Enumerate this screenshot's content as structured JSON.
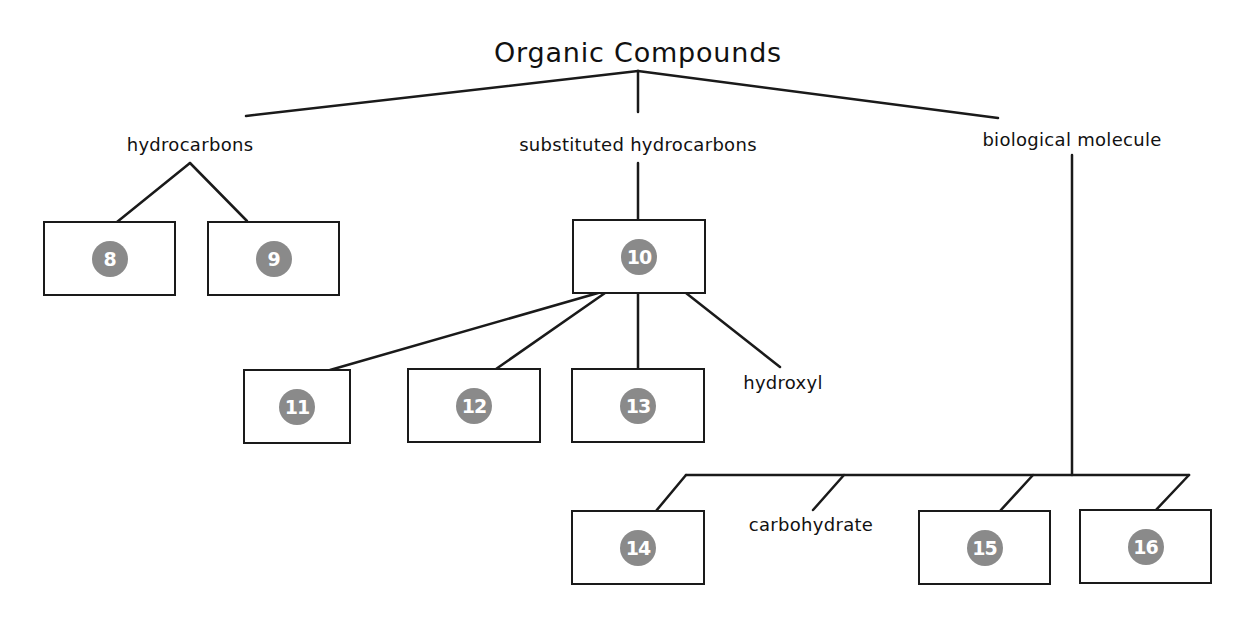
{
  "title": "Organic Compounds",
  "colors": {
    "line": "#1a1a1a",
    "badge_fill": "#8a8a8a",
    "badge_text": "#ffffff",
    "background": "#ffffff"
  },
  "categories": {
    "hydrocarbons": "hydrocarbons",
    "substituted_hydrocarbons": "substituted hydrocarbons",
    "biological_molecule": "biological molecule"
  },
  "sublabels": {
    "hydroxyl": "hydroxyl",
    "carbohydrate": "carbohydrate"
  },
  "blanks": [
    {
      "id": "8",
      "parent": "hydrocarbons"
    },
    {
      "id": "9",
      "parent": "hydrocarbons"
    },
    {
      "id": "10",
      "parent": "substituted hydrocarbons"
    },
    {
      "id": "11",
      "parent": "10"
    },
    {
      "id": "12",
      "parent": "10"
    },
    {
      "id": "13",
      "parent": "10"
    },
    {
      "id": "14",
      "parent": "biological molecule"
    },
    {
      "id": "15",
      "parent": "biological molecule"
    },
    {
      "id": "16",
      "parent": "biological molecule"
    }
  ]
}
